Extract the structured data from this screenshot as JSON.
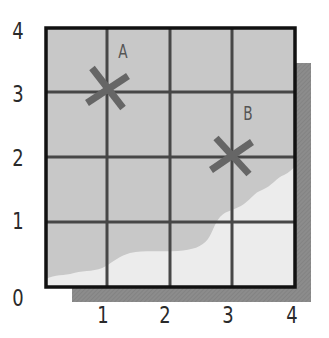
{
  "map": {
    "grid": {
      "x_ticks": [
        "1",
        "2",
        "3",
        "4"
      ],
      "y_ticks": [
        "0",
        "1",
        "2",
        "3",
        "4"
      ],
      "x_min": 0,
      "x_max": 4,
      "y_min": 0,
      "y_max": 4
    },
    "points": [
      {
        "label": "A",
        "x": 1,
        "y": 3,
        "marker": "cross"
      },
      {
        "label": "B",
        "x": 3,
        "y": 2,
        "marker": "cross"
      }
    ],
    "regions": [
      {
        "name": "shaded-area",
        "color": "#c8c8c8",
        "description": "darker grey region covering upper-left"
      },
      {
        "name": "light-area",
        "color": "#ececec",
        "description": "light region along bottom-right with wavy boundary"
      }
    ],
    "colors": {
      "frame": "#111111",
      "grid_line": "#474747",
      "shadow": "#8c8c8c",
      "marker": "#666666",
      "shaded_fill": "#c8c8c8",
      "light_fill": "#ececec"
    }
  }
}
